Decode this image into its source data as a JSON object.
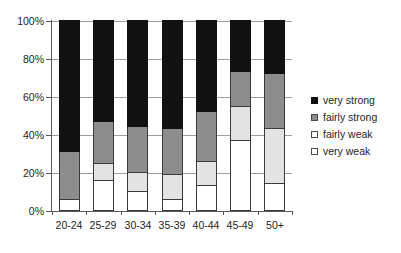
{
  "chart_data": {
    "type": "bar",
    "subtype": "stacked-100-percent",
    "title": "",
    "xlabel": "",
    "ylabel": "",
    "categories": [
      "20-24",
      "25-29",
      "30-34",
      "35-39",
      "40-44",
      "45-49",
      "50+"
    ],
    "ytick_labels": [
      "0%",
      "20%",
      "40%",
      "60%",
      "80%",
      "100%"
    ],
    "ytick_values": [
      0,
      20,
      40,
      60,
      80,
      100
    ],
    "ylim": [
      0,
      100
    ],
    "grid": true,
    "legend_position": "right",
    "series": [
      {
        "name": "very weak",
        "color": "#ffffff",
        "values": [
          6,
          16,
          10,
          6,
          13,
          37,
          14
        ]
      },
      {
        "name": "fairly weak",
        "color": "#e3e3e3",
        "values": [
          0,
          9,
          10,
          13,
          13,
          18,
          29
        ]
      },
      {
        "name": "fairly strong",
        "color": "#8d8d8d",
        "values": [
          25,
          22,
          24,
          24,
          26,
          18,
          29
        ]
      },
      {
        "name": "very strong",
        "color": "#111111",
        "values": [
          69,
          53,
          56,
          57,
          48,
          27,
          28
        ]
      }
    ],
    "legend": [
      {
        "label": "very strong",
        "swatch": "very-strong"
      },
      {
        "label": "fairly strong",
        "swatch": "fairly-strong"
      },
      {
        "label": "fairly weak",
        "swatch": "fairly-weak"
      },
      {
        "label": "very weak",
        "swatch": "very-weak"
      }
    ]
  }
}
